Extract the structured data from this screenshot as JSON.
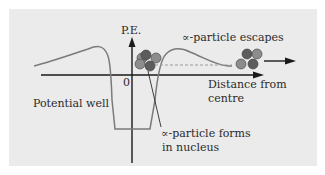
{
  "diagram": {
    "axis_y_label": "P.E.",
    "origin_label": "0",
    "axis_x_label_line1": "Distance from",
    "axis_x_label_line2": "centre",
    "escape_label": "∝-particle escapes",
    "well_label": "Potential well",
    "forms_label_line1": "∝-particle forms",
    "forms_label_line2": "in nucleus"
  },
  "colors": {
    "panel_bg": "#ebebeb",
    "curve": "#7a7a7a",
    "axis": "#1a1a1a",
    "particle_dark": "#5c5c5c",
    "particle_light": "#8d8d8d",
    "dashed": "#9a9a9a"
  }
}
